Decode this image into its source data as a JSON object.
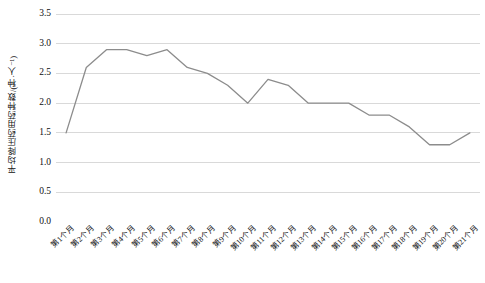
{
  "chart_data": {
    "type": "line",
    "title": "",
    "xlabel": "",
    "ylabel": "平均降压药用药种数/(种·人⁻¹)",
    "ylim": [
      0.0,
      3.5
    ],
    "ytick_labels": [
      "0.0",
      "0.5",
      "1.0",
      "1.5",
      "2.0",
      "2.5",
      "3.0",
      "3.5"
    ],
    "ytick_values": [
      0.0,
      0.5,
      1.0,
      1.5,
      2.0,
      2.5,
      3.0,
      3.5
    ],
    "grid": true,
    "grid_axis": "y",
    "legend": false,
    "legend_position": "none",
    "line_color": "#8c8c8c",
    "grid_color": "#d9d9d9",
    "axis_color": "#bfbfbf",
    "categories": [
      "第1个月",
      "第2个月",
      "第3个月",
      "第4个月",
      "第5个月",
      "第6个月",
      "第7个月",
      "第8个月",
      "第9个月",
      "第10个月",
      "第11个月",
      "第12个月",
      "第13个月",
      "第14个月",
      "第15个月",
      "第16个月",
      "第17个月",
      "第18个月",
      "第19个月",
      "第20个月",
      "第21个月"
    ],
    "values": [
      1.5,
      2.6,
      2.9,
      2.9,
      2.8,
      2.9,
      2.6,
      2.5,
      2.3,
      2.0,
      2.4,
      2.3,
      2.0,
      2.0,
      2.0,
      1.8,
      1.8,
      1.6,
      1.3,
      1.3,
      1.5
    ]
  }
}
